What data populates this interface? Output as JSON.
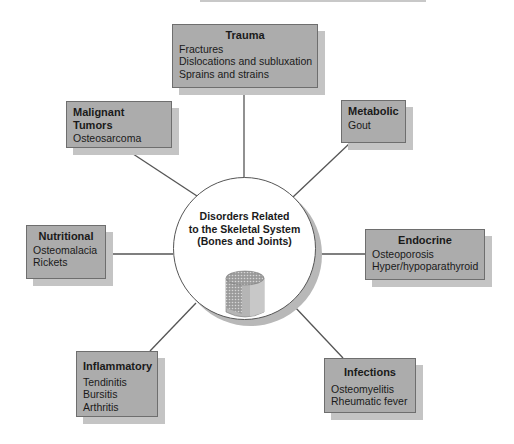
{
  "diagram": {
    "hub": {
      "lines": [
        "Disorders Related",
        "to the Skeletal System",
        "(Bones and Joints)"
      ],
      "icon": "bone-cross-section-icon"
    },
    "categories": [
      {
        "id": "trauma",
        "title": "Trauma",
        "items": [
          "Fractures",
          "Dislocations and subluxation",
          "Sprains and strains"
        ]
      },
      {
        "id": "malignant-tumors",
        "title": "Malignant Tumors",
        "items": [
          "Osteosarcoma"
        ]
      },
      {
        "id": "metabolic",
        "title": "Metabolic",
        "items": [
          "Gout"
        ]
      },
      {
        "id": "nutritional",
        "title": "Nutritional",
        "items": [
          "Osteomalacia",
          "Rickets"
        ]
      },
      {
        "id": "endocrine",
        "title": "Endocrine",
        "items": [
          "Osteoporosis",
          "Hyper/hypoparathyroid"
        ]
      },
      {
        "id": "inflammatory",
        "title": "Inflammatory",
        "items": [
          "Tendinitis",
          "Bursitis",
          "Arthritis"
        ]
      },
      {
        "id": "infections",
        "title": "Infections",
        "items": [
          "Osteomyelitis",
          "Rheumatic fever"
        ]
      }
    ],
    "colors": {
      "box_fill": "#acacac",
      "box_border": "#6e6e6e",
      "box_shadow": "#c4c4c4",
      "line": "#555555"
    }
  }
}
